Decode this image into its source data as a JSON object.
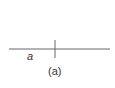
{
  "figure": {
    "variable_label": "a",
    "caption": "(a)",
    "colors": {
      "line": "#666666",
      "text": "#333333",
      "background": "#ffffff"
    },
    "axis_line": {
      "x1": 9,
      "y1": 49,
      "x2": 110,
      "y2": 49
    },
    "tick_mark": {
      "x1": 55,
      "y1": 40,
      "x2": 55,
      "y2": 58
    }
  }
}
